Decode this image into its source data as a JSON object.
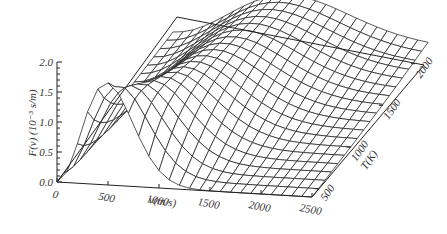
{
  "chart_data": {
    "type": "surface3d",
    "title": "",
    "xlabel": "v(m/s)",
    "ylabel": "T(K)",
    "zlabel": "F(v) (10⁻³ s/m)",
    "x_ticks": [
      "0",
      "500",
      "1000",
      "1500",
      "2000",
      "2500"
    ],
    "y_ticks": [
      "500",
      "1000",
      "1500",
      "2000"
    ],
    "z_ticks": [
      "0.0",
      "0.5",
      "1.0",
      "1.5",
      "2.0"
    ],
    "xlim": [
      0,
      2500
    ],
    "ylim": [
      400,
      2200
    ],
    "zlim": [
      0,
      2.0
    ],
    "peak": {
      "v": 470,
      "T": 400,
      "F": 1.75
    },
    "model": {
      "formula": "F(v)=4π(m/2πkT)^(3/2) v² exp(-mv²/2kT)",
      "mass_amu": 28
    },
    "grid": {
      "v_lines": 26,
      "T_lines": 19
    },
    "box": "back-floor outline"
  },
  "labels": {
    "z_axis": "F(v) (10⁻³ s/m)",
    "v_axis": "v(m/s)",
    "t_axis": "T(K)"
  }
}
